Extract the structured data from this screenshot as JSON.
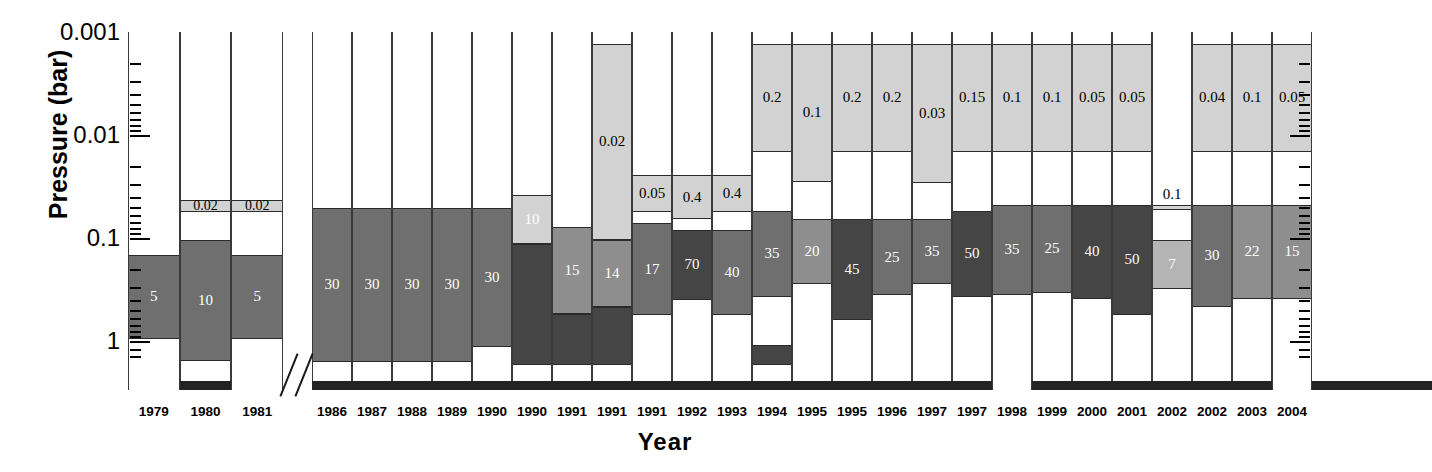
{
  "chart_data": {
    "type": "bar",
    "title": "",
    "xlabel": "Year",
    "ylabel": "Pressure (bar)",
    "yscale": "log",
    "ylim": [
      0.001,
      2.0
    ],
    "y_axis_direction": "inverted",
    "ytick_labels": [
      "0.001",
      "0.01",
      "0.1",
      "1"
    ],
    "ytick_values": [
      0.001,
      0.01,
      0.1,
      1
    ],
    "grid": false,
    "legend": null,
    "axis_break_after_category_index": 2,
    "categories": [
      "1979",
      "1980",
      "1981",
      "1986",
      "1987",
      "1988",
      "1989",
      "1990",
      "1990",
      "1991",
      "1991",
      "1991",
      "1992",
      "1993",
      "1994",
      "1995",
      "1995",
      "1996",
      "1997",
      "1997",
      "1998",
      "1999",
      "2000",
      "2001",
      "2002",
      "2002",
      "2003",
      "2004"
    ],
    "bars": [
      {
        "year": "1979",
        "segments": [
          {
            "label": "5",
            "shade": "mid",
            "p_top": 0.145,
            "p_bottom": 0.95,
            "label_inside": true,
            "label_color": "#ffffff"
          }
        ]
      },
      {
        "year": "1980",
        "segments": [
          {
            "label": "0.02",
            "shade": "light",
            "p_top": 0.0425,
            "p_bottom": 0.056,
            "label_inside": true,
            "label_color": "#000000"
          },
          {
            "label": "10",
            "shade": "mid",
            "p_top": 0.105,
            "p_bottom": 1.55,
            "label_inside": true,
            "label_color": "#ffffff"
          }
        ]
      },
      {
        "year": "1981",
        "segments": [
          {
            "label": "0.02",
            "shade": "light",
            "p_top": 0.0425,
            "p_bottom": 0.056,
            "label_inside": true,
            "label_color": "#000000"
          },
          {
            "label": "5",
            "shade": "mid",
            "p_top": 0.145,
            "p_bottom": 0.95,
            "label_inside": true,
            "label_color": "#ffffff"
          }
        ]
      },
      {
        "year": "1986",
        "segments": [
          {
            "label": "30",
            "shade": "mid",
            "p_top": 0.051,
            "p_bottom": 1.6,
            "label_inside": true,
            "label_color": "#ffffff"
          }
        ]
      },
      {
        "year": "1987",
        "segments": [
          {
            "label": "30",
            "shade": "mid",
            "p_top": 0.051,
            "p_bottom": 1.6,
            "label_inside": true,
            "label_color": "#ffffff"
          }
        ]
      },
      {
        "year": "1988",
        "segments": [
          {
            "label": "30",
            "shade": "mid",
            "p_top": 0.051,
            "p_bottom": 1.6,
            "label_inside": true,
            "label_color": "#ffffff"
          }
        ]
      },
      {
        "year": "1989",
        "segments": [
          {
            "label": "30",
            "shade": "mid",
            "p_top": 0.051,
            "p_bottom": 1.6,
            "label_inside": true,
            "label_color": "#ffffff"
          }
        ]
      },
      {
        "year": "1990",
        "segments": [
          {
            "label": "30",
            "shade": "mid",
            "p_top": 0.051,
            "p_bottom": 1.15,
            "label_inside": true,
            "label_color": "#ffffff"
          }
        ]
      },
      {
        "year": "1990b",
        "segments": [
          {
            "label": "10",
            "shade": "light",
            "p_top": 0.038,
            "p_bottom": 0.115,
            "label_inside": true,
            "label_color": "#ffffff"
          },
          {
            "label": "",
            "shade": "darkest",
            "p_top": 0.115,
            "p_bottom": 1.7,
            "label_inside": false,
            "label_color": "#ffffff"
          }
        ]
      },
      {
        "year": "1991a",
        "segments": [
          {
            "label": "15",
            "shade": "mid2",
            "p_top": 0.0775,
            "p_bottom": 0.55,
            "label_inside": true,
            "label_color": "#ffffff"
          },
          {
            "label": "",
            "shade": "darkest",
            "p_top": 0.55,
            "p_bottom": 1.7,
            "label_inside": false,
            "label_color": "#ffffff"
          }
        ]
      },
      {
        "year": "1991b",
        "segments": [
          {
            "label": "0.02",
            "shade": "light",
            "p_top": 0.0013,
            "p_bottom": 0.104,
            "label_inside": true,
            "label_color": "#000000"
          },
          {
            "label": "14",
            "shade": "mid2",
            "p_top": 0.104,
            "p_bottom": 0.47,
            "label_inside": true,
            "label_color": "#ffffff"
          },
          {
            "label": "",
            "shade": "darkest",
            "p_top": 0.47,
            "p_bottom": 1.7,
            "label_inside": false,
            "label_color": "#ffffff"
          }
        ]
      },
      {
        "year": "1991c",
        "segments": [
          {
            "label": "0.05",
            "shade": "light",
            "p_top": 0.0246,
            "p_bottom": 0.0565,
            "label_inside": true,
            "label_color": "#000000"
          },
          {
            "label": "17",
            "shade": "mid",
            "p_top": 0.072,
            "p_bottom": 0.56,
            "label_inside": true,
            "label_color": "#ffffff"
          }
        ]
      },
      {
        "year": "1992",
        "segments": [
          {
            "label": "0.4",
            "shade": "light",
            "p_top": 0.0246,
            "p_bottom": 0.0655,
            "label_inside": true,
            "label_color": "#000000"
          },
          {
            "label": "70",
            "shade": "darkest",
            "p_top": 0.083,
            "p_bottom": 0.4,
            "label_inside": true,
            "label_color": "#ffffff"
          }
        ]
      },
      {
        "year": "1993",
        "segments": [
          {
            "label": "0.4",
            "shade": "light",
            "p_top": 0.0246,
            "p_bottom": 0.0565,
            "label_inside": true,
            "label_color": "#000000"
          },
          {
            "label": "40",
            "shade": "mid",
            "p_top": 0.083,
            "p_bottom": 0.56,
            "label_inside": true,
            "label_color": "#ffffff"
          }
        ]
      },
      {
        "year": "1994",
        "segments": [
          {
            "label": "0.2",
            "shade": "light",
            "p_top": 0.0013,
            "p_bottom": 0.0145,
            "label_inside": true,
            "label_color": "#000000"
          },
          {
            "label": "35",
            "shade": "mid",
            "p_top": 0.0545,
            "p_bottom": 0.37,
            "label_inside": true,
            "label_color": "#ffffff"
          },
          {
            "label": "",
            "shade": "darkest",
            "p_top": 1.1,
            "p_bottom": 1.7,
            "label_inside": false,
            "label_color": "#ffffff"
          }
        ]
      },
      {
        "year": "1995a",
        "segments": [
          {
            "label": "0.1",
            "shade": "light",
            "p_top": 0.0013,
            "p_bottom": 0.0285,
            "label_inside": true,
            "label_color": "#000000"
          },
          {
            "label": "20",
            "shade": "mid2",
            "p_top": 0.065,
            "p_bottom": 0.28,
            "label_inside": true,
            "label_color": "#ffffff"
          }
        ]
      },
      {
        "year": "1995b",
        "segments": [
          {
            "label": "0.2",
            "shade": "light",
            "p_top": 0.0013,
            "p_bottom": 0.0145,
            "label_inside": true,
            "label_color": "#000000"
          },
          {
            "label": "45",
            "shade": "darkest",
            "p_top": 0.065,
            "p_bottom": 0.62,
            "label_inside": true,
            "label_color": "#ffffff"
          }
        ]
      },
      {
        "year": "1996",
        "segments": [
          {
            "label": "0.2",
            "shade": "light",
            "p_top": 0.0013,
            "p_bottom": 0.0145,
            "label_inside": true,
            "label_color": "#000000"
          },
          {
            "label": "25",
            "shade": "mid",
            "p_top": 0.065,
            "p_bottom": 0.36,
            "label_inside": true,
            "label_color": "#ffffff"
          }
        ]
      },
      {
        "year": "1997a",
        "segments": [
          {
            "label": "0.03",
            "shade": "light",
            "p_top": 0.0013,
            "p_bottom": 0.029,
            "label_inside": true,
            "label_color": "#000000"
          },
          {
            "label": "35",
            "shade": "mid",
            "p_top": 0.065,
            "p_bottom": 0.28,
            "label_inside": true,
            "label_color": "#ffffff"
          }
        ]
      },
      {
        "year": "1997b",
        "segments": [
          {
            "label": "0.15",
            "shade": "light",
            "p_top": 0.0013,
            "p_bottom": 0.0145,
            "label_inside": true,
            "label_color": "#000000"
          },
          {
            "label": "50",
            "shade": "darkest",
            "p_top": 0.055,
            "p_bottom": 0.37,
            "label_inside": true,
            "label_color": "#ffffff"
          }
        ]
      },
      {
        "year": "1998",
        "segments": [
          {
            "label": "0.1",
            "shade": "light",
            "p_top": 0.0013,
            "p_bottom": 0.0145,
            "label_inside": true,
            "label_color": "#000000"
          },
          {
            "label": "35",
            "shade": "mid",
            "p_top": 0.0475,
            "p_bottom": 0.36,
            "label_inside": true,
            "label_color": "#ffffff"
          }
        ]
      },
      {
        "year": "1999",
        "segments": [
          {
            "label": "0.1",
            "shade": "light",
            "p_top": 0.0013,
            "p_bottom": 0.0145,
            "label_inside": true,
            "label_color": "#000000"
          },
          {
            "label": "25",
            "shade": "mid",
            "p_top": 0.0475,
            "p_bottom": 0.34,
            "label_inside": true,
            "label_color": "#ffffff"
          }
        ]
      },
      {
        "year": "2000",
        "segments": [
          {
            "label": "0.05",
            "shade": "light",
            "p_top": 0.0013,
            "p_bottom": 0.0145,
            "label_inside": true,
            "label_color": "#000000"
          },
          {
            "label": "40",
            "shade": "darkest",
            "p_top": 0.0475,
            "p_bottom": 0.39,
            "label_inside": true,
            "label_color": "#ffffff"
          }
        ]
      },
      {
        "year": "2001",
        "segments": [
          {
            "label": "0.05",
            "shade": "light",
            "p_top": 0.0013,
            "p_bottom": 0.0145,
            "label_inside": true,
            "label_color": "#000000"
          },
          {
            "label": "50",
            "shade": "darkest",
            "p_top": 0.0475,
            "p_bottom": 0.56,
            "label_inside": true,
            "label_color": "#ffffff"
          }
        ]
      },
      {
        "year": "2002a",
        "segments": [
          {
            "label": "0.1",
            "shade": "light",
            "p_top": 0.0475,
            "p_bottom": 0.053,
            "label_inside": false,
            "label_color": "#000000"
          },
          {
            "label": "7",
            "shade": "lightmid",
            "p_top": 0.105,
            "p_bottom": 0.31,
            "label_inside": true,
            "label_color": "#ffffff"
          }
        ]
      },
      {
        "year": "2002b",
        "segments": [
          {
            "label": "0.04",
            "shade": "light",
            "p_top": 0.0013,
            "p_bottom": 0.0145,
            "label_inside": true,
            "label_color": "#000000"
          },
          {
            "label": "30",
            "shade": "mid",
            "p_top": 0.0475,
            "p_bottom": 0.47,
            "label_inside": true,
            "label_color": "#ffffff"
          }
        ]
      },
      {
        "year": "2003",
        "segments": [
          {
            "label": "0.1",
            "shade": "light",
            "p_top": 0.0013,
            "p_bottom": 0.0145,
            "label_inside": true,
            "label_color": "#000000"
          },
          {
            "label": "22",
            "shade": "mid2",
            "p_top": 0.0475,
            "p_bottom": 0.39,
            "label_inside": true,
            "label_color": "#ffffff"
          }
        ]
      },
      {
        "year": "2004",
        "segments": [
          {
            "label": "0.05",
            "shade": "light",
            "p_top": 0.0013,
            "p_bottom": 0.0145,
            "label_inside": true,
            "label_color": "#000000"
          },
          {
            "label": "15",
            "shade": "mid2",
            "p_top": 0.0475,
            "p_bottom": 0.39,
            "label_inside": true,
            "label_color": "#ffffff"
          }
        ]
      }
    ]
  },
  "colors": {
    "light": "#d2d2d2",
    "lightmid": "#b4b4b4",
    "mid2": "#8e8e8e",
    "mid": "#6f6f6f",
    "darkest": "#454545",
    "baseband": "#232323",
    "axis": "#000000",
    "background": "#ffffff"
  }
}
